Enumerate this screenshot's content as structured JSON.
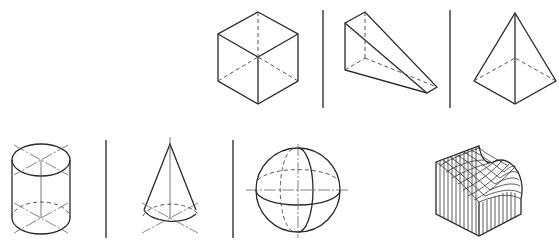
{
  "figure": {
    "colors": {
      "line": "#2a2a2a",
      "background": "#ffffff"
    },
    "rows": [
      {
        "items": [
          {
            "id": "cube",
            "label": "cube"
          },
          {
            "id": "wedge",
            "label": "triangular prism (wedge)"
          },
          {
            "id": "pyramid",
            "label": "square pyramid"
          }
        ]
      },
      {
        "items": [
          {
            "id": "cylinder",
            "label": "cylinder"
          },
          {
            "id": "cone",
            "label": "cone"
          },
          {
            "id": "sphere",
            "label": "sphere"
          },
          {
            "id": "surface",
            "label": "freeform surface (wireframe mesh)"
          }
        ]
      }
    ],
    "line_styles": [
      "solid visible edges",
      "dashed hidden edges",
      "chain center lines"
    ]
  }
}
